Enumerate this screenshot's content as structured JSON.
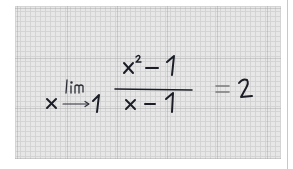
{
  "image": {
    "description": "Handwritten limit formula on gray graph paper",
    "formula_text": "lim x→1 (x² − 1)/(x − 1) = 2",
    "parts": {
      "operator": "lim",
      "approach_variable": "x",
      "approach_value": "1",
      "numerator": "x² − 1",
      "denominator": "x − 1",
      "equals": "=",
      "result": "2"
    }
  },
  "colors": {
    "paper": "#e7e7e7",
    "grid_minor": "#d2d2d2",
    "grid_major": "#969696",
    "ink": "#1a1d26",
    "equals_ink": "#7a7a7a",
    "edge_line": "#c8c8c8"
  }
}
